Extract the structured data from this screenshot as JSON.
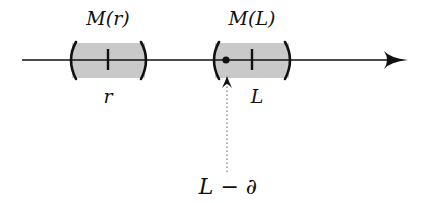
{
  "diagram": {
    "type": "number-line",
    "axis": {
      "x_start": 22,
      "x_end": 408,
      "y": 60,
      "direction": "right",
      "color": "#111111"
    },
    "intervals": [
      {
        "id": "M_r",
        "label_top": "M(r)",
        "label_bottom": "r",
        "center_x": 108,
        "left_x": 71,
        "right_x": 146,
        "fill": "#c8c8c8"
      },
      {
        "id": "M_L",
        "label_top": "M(L)",
        "label_bottom": "L",
        "center_x": 252,
        "left_x": 214,
        "right_x": 290,
        "fill": "#c8c8c8",
        "marked_point_x": 226
      }
    ],
    "pointer": {
      "label": "L − ∂",
      "x": 227,
      "from_y": 172,
      "to_y": 76,
      "style": "dotted"
    }
  }
}
